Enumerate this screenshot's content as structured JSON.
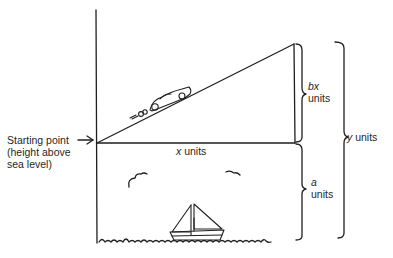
{
  "diagram": {
    "type": "geometry-word-problem-illustration",
    "labels": {
      "starting_point": [
        "Starting point",
        "(height above",
        "sea level)"
      ],
      "x": {
        "var": "x",
        "unit": "units"
      },
      "bx": {
        "var": "bx",
        "unit": "units"
      },
      "a": {
        "var": "a",
        "unit": "units"
      },
      "y": {
        "var": "y",
        "unit": "units"
      }
    },
    "elements": [
      "vertical-axis",
      "slope-line",
      "horizontal-baseline",
      "right-vertical-side",
      "car",
      "sailboat",
      "clouds",
      "water-waves",
      "bracket-bx",
      "bracket-a",
      "bracket-y",
      "start-arrow"
    ],
    "colors": {
      "stroke": "#1f1f1f",
      "background": "#ffffff"
    }
  }
}
